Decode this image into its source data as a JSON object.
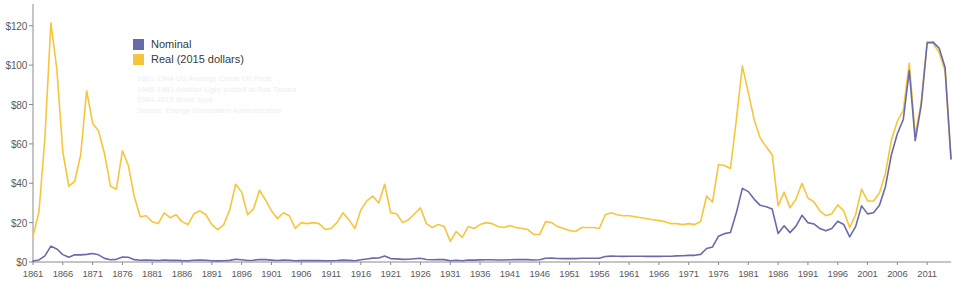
{
  "chart_data": {
    "type": "line",
    "title": "",
    "subtitle": "",
    "xlabel": "",
    "ylabel": "",
    "ylim": [
      0,
      128
    ],
    "xlim": [
      1861,
      2015
    ],
    "grid": false,
    "legend_position": "inside-top-left",
    "y_ticks": [
      0,
      20,
      40,
      60,
      80,
      100,
      120
    ],
    "y_tick_labels": [
      "$0",
      "$20",
      "$40",
      "$60",
      "$80",
      "$100",
      "$120"
    ],
    "x_tick_labels": [
      "1861",
      "1866",
      "1871",
      "1876",
      "1881",
      "1886",
      "1891",
      "1896",
      "1901",
      "1906",
      "1911",
      "1916",
      "1921",
      "1926",
      "1931",
      "1936",
      "1941",
      "1946",
      "1951",
      "1956",
      "1961",
      "1966",
      "1971",
      "1976",
      "1981",
      "1986",
      "1991",
      "1996",
      "2001",
      "2006",
      "2011"
    ],
    "x": [
      1861,
      1862,
      1863,
      1864,
      1865,
      1866,
      1867,
      1868,
      1869,
      1870,
      1871,
      1872,
      1873,
      1874,
      1875,
      1876,
      1877,
      1878,
      1879,
      1880,
      1881,
      1882,
      1883,
      1884,
      1885,
      1886,
      1887,
      1888,
      1889,
      1890,
      1891,
      1892,
      1893,
      1894,
      1895,
      1896,
      1897,
      1898,
      1899,
      1900,
      1901,
      1902,
      1903,
      1904,
      1905,
      1906,
      1907,
      1908,
      1909,
      1910,
      1911,
      1912,
      1913,
      1914,
      1915,
      1916,
      1917,
      1918,
      1919,
      1920,
      1921,
      1922,
      1923,
      1924,
      1925,
      1926,
      1927,
      1928,
      1929,
      1930,
      1931,
      1932,
      1933,
      1934,
      1935,
      1936,
      1937,
      1938,
      1939,
      1940,
      1941,
      1942,
      1943,
      1944,
      1945,
      1946,
      1947,
      1948,
      1949,
      1950,
      1951,
      1952,
      1953,
      1954,
      1955,
      1956,
      1957,
      1958,
      1959,
      1960,
      1961,
      1962,
      1963,
      1964,
      1965,
      1966,
      1967,
      1968,
      1969,
      1970,
      1971,
      1972,
      1973,
      1974,
      1975,
      1976,
      1977,
      1978,
      1979,
      1980,
      1981,
      1982,
      1983,
      1984,
      1985,
      1986,
      1987,
      1988,
      1989,
      1990,
      1991,
      1992,
      1993,
      1994,
      1995,
      1996,
      1997,
      1998,
      1999,
      2000,
      2001,
      2002,
      2003,
      2004,
      2005,
      2006,
      2007,
      2008,
      2009,
      2010,
      2011,
      2012,
      2013,
      2014,
      2015
    ],
    "series": [
      {
        "name": "Nominal",
        "color": "#6a6aab",
        "values": [
          0.49,
          1.05,
          3.15,
          8.06,
          6.59,
          3.74,
          2.41,
          3.63,
          3.64,
          3.86,
          4.34,
          3.64,
          1.83,
          1.17,
          1.35,
          2.56,
          2.42,
          1.19,
          0.86,
          0.95,
          0.86,
          0.78,
          1.0,
          0.84,
          0.88,
          0.71,
          0.67,
          0.88,
          0.94,
          0.87,
          0.67,
          0.56,
          0.64,
          0.84,
          1.36,
          1.18,
          0.79,
          0.91,
          1.29,
          1.19,
          0.96,
          0.8,
          0.94,
          0.86,
          0.62,
          0.73,
          0.72,
          0.72,
          0.7,
          0.61,
          0.61,
          0.74,
          0.95,
          0.81,
          0.64,
          1.1,
          1.56,
          1.98,
          2.01,
          3.07,
          1.73,
          1.61,
          1.34,
          1.43,
          1.68,
          1.88,
          1.3,
          1.17,
          1.27,
          1.19,
          0.65,
          0.87,
          0.67,
          1.0,
          0.97,
          1.09,
          1.18,
          1.13,
          1.02,
          1.02,
          1.14,
          1.19,
          1.2,
          1.21,
          1.05,
          1.12,
          1.9,
          1.99,
          1.78,
          1.71,
          1.71,
          1.71,
          1.93,
          1.93,
          1.93,
          1.93,
          2.79,
          2.97,
          2.9,
          2.88,
          2.89,
          2.9,
          2.89,
          2.88,
          2.86,
          2.88,
          2.92,
          2.94,
          3.09,
          3.18,
          3.39,
          3.39,
          3.89,
          6.87,
          7.67,
          13.1,
          14.4,
          14.95,
          25.1,
          37.42,
          35.75,
          31.83,
          28.78,
          28.07,
          26.92,
          14.44,
          18.44,
          14.92,
          18.23,
          23.73,
          20.0,
          19.32,
          16.97,
          15.82,
          17.02,
          20.67,
          19.09,
          12.72,
          17.97,
          28.5,
          24.44,
          25.02,
          28.83,
          38.27,
          54.52,
          65.14,
          72.39,
          97.26,
          61.67,
          79.5,
          111.26,
          111.67,
          108.66,
          98.95,
          52.39
        ]
      },
      {
        "name": "Real (2015 dollars)",
        "color": "#f5c63c",
        "values": [
          13.0,
          25.5,
          63.0,
          121.5,
          98.0,
          56.0,
          38.5,
          41.0,
          54.5,
          87.0,
          70.5,
          66.5,
          55.0,
          38.5,
          37.0,
          56.5,
          49.0,
          33.0,
          23.0,
          23.5,
          20.5,
          19.5,
          25.0,
          22.5,
          24.0,
          20.5,
          19.0,
          24.5,
          26.0,
          24.0,
          19.0,
          16.5,
          19.0,
          26.5,
          39.5,
          35.5,
          24.0,
          27.0,
          36.5,
          31.5,
          26.0,
          22.0,
          25.0,
          23.5,
          17.0,
          20.0,
          19.5,
          20.0,
          19.5,
          16.5,
          17.0,
          20.0,
          25.0,
          21.5,
          17.0,
          26.5,
          31.0,
          33.5,
          30.0,
          39.5,
          25.0,
          24.5,
          20.0,
          21.5,
          24.5,
          27.5,
          19.5,
          17.5,
          19.0,
          18.0,
          10.5,
          15.5,
          12.5,
          18.0,
          17.0,
          19.0,
          20.0,
          19.5,
          18.0,
          17.5,
          18.5,
          17.5,
          17.0,
          16.5,
          14.0,
          14.0,
          20.5,
          20.0,
          18.0,
          17.0,
          16.0,
          15.5,
          17.5,
          17.5,
          17.5,
          17.0,
          24.0,
          25.0,
          24.0,
          23.5,
          23.5,
          23.0,
          22.5,
          22.0,
          21.5,
          21.0,
          20.5,
          19.5,
          19.5,
          19.0,
          19.5,
          19.0,
          20.5,
          33.5,
          30.5,
          49.5,
          49.0,
          47.5,
          72.5,
          99.5,
          86.0,
          72.0,
          63.0,
          58.5,
          54.5,
          28.5,
          35.5,
          27.5,
          32.0,
          40.0,
          32.5,
          30.5,
          26.0,
          23.5,
          24.5,
          29.0,
          26.0,
          17.5,
          24.0,
          37.0,
          31.0,
          31.0,
          35.0,
          45.0,
          62.0,
          71.5,
          77.0,
          101.0,
          64.5,
          81.0,
          112.0,
          111.0,
          106.5,
          97.0,
          52.5
        ]
      }
    ]
  },
  "legend": {
    "items": [
      {
        "label": "Nominal",
        "color": "#6a6aab"
      },
      {
        "label": "Real (2015 dollars)",
        "color": "#f5c63c"
      }
    ]
  },
  "notes": {
    "lines": [
      "1861-1944 US Average Crude Oil Price",
      "1945-1983 Arabian Light posted at Ras Tanura",
      "1984-2015 Brent Spot",
      "Source: Energy Information Administration"
    ]
  }
}
